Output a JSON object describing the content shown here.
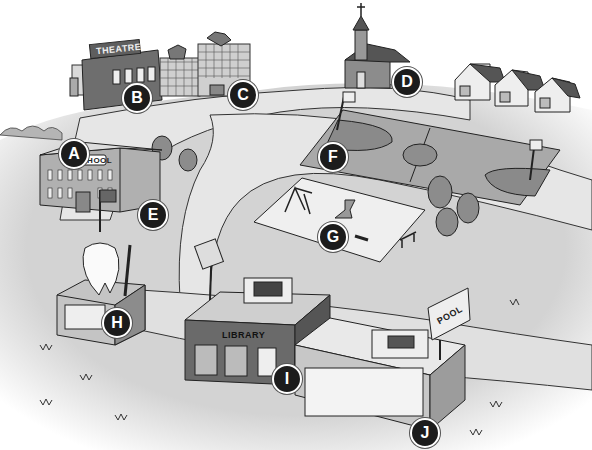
{
  "colors": {
    "ground": "#d3d3d3",
    "path": "#e4e4e4",
    "court": "#a9a9a9",
    "court_key": "#8a8a8a",
    "building_dark": "#6e6e6e",
    "building_mid": "#9c9c9c",
    "building_light": "#dadada",
    "sand": "#efefef",
    "tree": "#8c8c8c",
    "outline": "#2a2a2a",
    "marker": "#1c1c1c"
  },
  "signs": {
    "theatre": "THEATRE",
    "school": "SCHOOL",
    "library": "LIBRARY",
    "pool": "POOL"
  },
  "markers": [
    {
      "letter": "A",
      "place": "theatre",
      "x": 60,
      "y": 139
    },
    {
      "letter": "B",
      "place": "clothing and burger shops",
      "x": 123,
      "y": 83
    },
    {
      "letter": "C",
      "place": "burger restaurant",
      "x": 228,
      "y": 80
    },
    {
      "letter": "D",
      "place": "church",
      "x": 392,
      "y": 67
    },
    {
      "letter": "E",
      "place": "school",
      "x": 140,
      "y": 200
    },
    {
      "letter": "F",
      "place": "basketball court",
      "x": 319,
      "y": 142
    },
    {
      "letter": "G",
      "place": "playground",
      "x": 319,
      "y": 222
    },
    {
      "letter": "H",
      "place": "dentist",
      "x": 103,
      "y": 308
    },
    {
      "letter": "I",
      "place": "library",
      "x": 272,
      "y": 364
    },
    {
      "letter": "J",
      "place": "swimming pool",
      "x": 410,
      "y": 420
    }
  ]
}
